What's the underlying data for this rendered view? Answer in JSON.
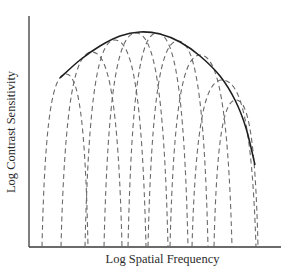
{
  "figure": {
    "xlabel": "Log Spatial Frequency",
    "ylabel": "Log Contrast Sensitivity",
    "colors": {
      "axis": "#3a3a3a",
      "envelope": "#1f1f1f",
      "channels": "#6a6a6a",
      "background": "#ffffff"
    }
  },
  "diagram": {
    "envelope": {
      "style": "solid",
      "points": [
        [
          60,
          78
        ],
        [
          80,
          60
        ],
        [
          100,
          46
        ],
        [
          120,
          36
        ],
        [
          140,
          32
        ],
        [
          160,
          34
        ],
        [
          180,
          42
        ],
        [
          200,
          56
        ],
        [
          220,
          76
        ],
        [
          235,
          100
        ],
        [
          246,
          128
        ],
        [
          255,
          165
        ]
      ]
    },
    "channels": [
      {
        "left": 42,
        "peak": [
          66,
          74
        ],
        "right": 88
      },
      {
        "left": 61,
        "peak": [
          92,
          52
        ],
        "right": 122
      },
      {
        "left": 85,
        "peak": [
          115,
          40
        ],
        "right": 146
      },
      {
        "left": 104,
        "peak": [
          136,
          33
        ],
        "right": 168
      },
      {
        "left": 128,
        "peak": [
          157,
          33
        ],
        "right": 188
      },
      {
        "left": 148,
        "peak": [
          178,
          41
        ],
        "right": 208
      },
      {
        "left": 170,
        "peak": [
          200,
          55
        ],
        "right": 232
      },
      {
        "left": 192,
        "peak": [
          222,
          80
        ],
        "right": 256
      },
      {
        "left": 214,
        "peak": [
          236,
          100
        ],
        "right": 258
      }
    ]
  }
}
